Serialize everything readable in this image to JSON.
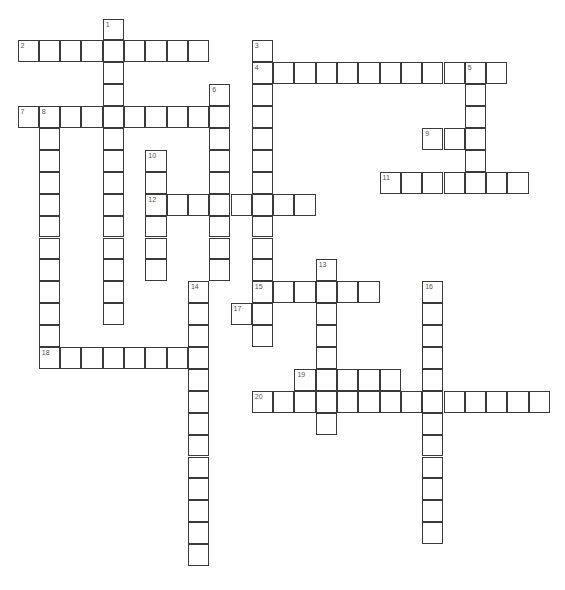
{
  "puzzle": {
    "grid": {
      "origin_x": 18,
      "origin_y": 19,
      "cell_w": 21.3,
      "cell_h": 21.9
    },
    "entries": [
      {
        "number": 1,
        "direction": "down",
        "row": 0,
        "col": 4,
        "length": 14
      },
      {
        "number": 2,
        "direction": "across",
        "row": 1,
        "col": 0,
        "length": 9
      },
      {
        "number": 3,
        "direction": "down",
        "row": 1,
        "col": 11,
        "length": 14
      },
      {
        "number": 4,
        "direction": "across",
        "row": 2,
        "col": 11,
        "length": 12
      },
      {
        "number": 5,
        "direction": "down",
        "row": 2,
        "col": 21,
        "length": 6
      },
      {
        "number": 6,
        "direction": "down",
        "row": 3,
        "col": 9,
        "length": 9
      },
      {
        "number": 7,
        "direction": "across",
        "row": 4,
        "col": 0,
        "length": 10
      },
      {
        "number": 8,
        "direction": "down",
        "row": 4,
        "col": 1,
        "length": 12
      },
      {
        "number": 9,
        "direction": "across",
        "row": 5,
        "col": 19,
        "length": 3
      },
      {
        "number": 10,
        "direction": "down",
        "row": 6,
        "col": 6,
        "length": 6
      },
      {
        "number": 11,
        "direction": "across",
        "row": 7,
        "col": 17,
        "length": 7
      },
      {
        "number": 12,
        "direction": "across",
        "row": 8,
        "col": 6,
        "length": 8
      },
      {
        "number": 13,
        "direction": "down",
        "row": 11,
        "col": 14,
        "length": 8
      },
      {
        "number": 14,
        "direction": "down",
        "row": 12,
        "col": 8,
        "length": 13
      },
      {
        "number": 15,
        "direction": "across",
        "row": 12,
        "col": 11,
        "length": 6
      },
      {
        "number": 16,
        "direction": "down",
        "row": 12,
        "col": 19,
        "length": 12
      },
      {
        "number": 17,
        "direction": "across",
        "row": 13,
        "col": 10,
        "length": 2
      },
      {
        "number": 18,
        "direction": "across",
        "row": 15,
        "col": 1,
        "length": 8
      },
      {
        "number": 19,
        "direction": "across",
        "row": 16,
        "col": 13,
        "length": 5
      },
      {
        "number": 20,
        "direction": "across",
        "row": 17,
        "col": 11,
        "length": 14
      }
    ]
  }
}
